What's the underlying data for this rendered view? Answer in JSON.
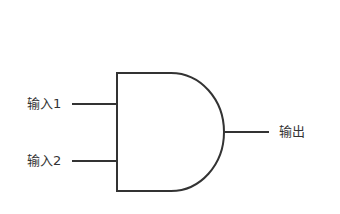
{
  "diagram": {
    "type": "AND gate",
    "inputs": [
      {
        "label": "输入1"
      },
      {
        "label": "输入2"
      }
    ],
    "output": {
      "label": "输出"
    },
    "colors": {
      "stroke": "#333333",
      "text": "#333333",
      "background": "#ffffff"
    }
  }
}
